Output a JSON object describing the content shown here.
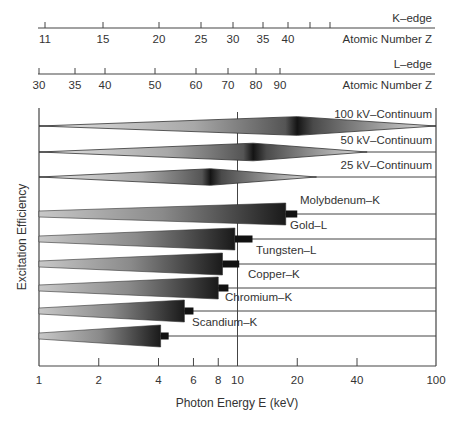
{
  "chart_data": {
    "type": "diagram-bar",
    "title": "",
    "xlabel": "Photon Energy E (keV)",
    "ylabel": "Excitation Efficiency",
    "xscale": "log",
    "xlim": [
      1,
      100
    ],
    "x_ticks": [
      {
        "value": 1,
        "label": "1"
      },
      {
        "value": 2,
        "label": "2"
      },
      {
        "value": 4,
        "label": "4"
      },
      {
        "value": 6,
        "label": "6"
      },
      {
        "value": 8,
        "label": "8"
      },
      {
        "value": 10,
        "label": "10"
      },
      {
        "value": 20,
        "label": "20"
      },
      {
        "value": 40,
        "label": "40"
      },
      {
        "value": 100,
        "label": "100"
      }
    ],
    "reference_line_keV": 10,
    "top_axes": [
      {
        "name": "K-edge",
        "title": "K–edge",
        "label": "Atomic Number Z",
        "ticks": [
          {
            "energy_keV": 1.07,
            "label": "11"
          },
          {
            "energy_keV": 1.74,
            "label": "15"
          },
          {
            "energy_keV": 3.6,
            "label": "20"
          },
          {
            "energy_keV": 5.0,
            "label": "25"
          },
          {
            "energy_keV": 6.5,
            "label": "30"
          },
          {
            "energy_keV": 9.0,
            "label": "35"
          },
          {
            "energy_keV": 12.0,
            "label": "40"
          },
          {
            "energy_keV": 15.0,
            "label": ""
          },
          {
            "energy_keV": 19.0,
            "label": ""
          }
        ]
      },
      {
        "name": "L-edge",
        "title": "L–edge",
        "label": "Atomic Number Z",
        "ticks": [
          {
            "energy_keV": 1.0,
            "label": "30"
          },
          {
            "energy_keV": 1.5,
            "label": "35"
          },
          {
            "energy_keV": 2.0,
            "label": "40"
          },
          {
            "energy_keV": 3.6,
            "label": "50"
          },
          {
            "energy_keV": 5.9,
            "label": "60"
          },
          {
            "energy_keV": 8.6,
            "label": "70"
          },
          {
            "energy_keV": 11.9,
            "label": "80"
          },
          {
            "energy_keV": 16.0,
            "label": "90"
          }
        ]
      }
    ],
    "continua": [
      {
        "name": "100 kV–Continuum",
        "start_keV": 1,
        "peak_keV": 20,
        "end_keV": 100
      },
      {
        "name": "50 kV–Continuum",
        "start_keV": 1,
        "peak_keV": 12,
        "end_keV": 45
      },
      {
        "name": "25 kV–Continuum",
        "start_keV": 1,
        "peak_keV": 7.3,
        "end_keV": 25
      }
    ],
    "characteristic_lines": [
      {
        "name": "Molybdenum–K",
        "edge_keV": 17.5,
        "line_keV": 20.0
      },
      {
        "name": "Gold–L",
        "edge_keV": 9.7,
        "line_keV": 11.9
      },
      {
        "name": "Tungsten–L",
        "edge_keV": 8.4,
        "line_keV": 10.2
      },
      {
        "name": "Copper–K",
        "edge_keV": 8.0,
        "line_keV": 9.0
      },
      {
        "name": "Chromium–K",
        "edge_keV": 5.4,
        "line_keV": 6.0
      },
      {
        "name": "Scandium–K",
        "edge_keV": 4.1,
        "line_keV": 4.5
      }
    ]
  }
}
